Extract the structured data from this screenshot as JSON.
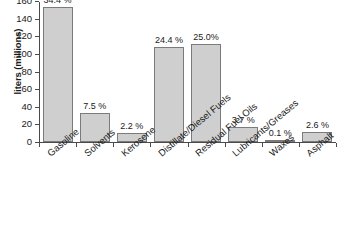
{
  "chart_data": {
    "type": "bar",
    "title": "",
    "xlabel": "",
    "ylabel": "liters (millions)",
    "ylim": [
      0,
      160
    ],
    "ytick_values": [
      0,
      20,
      40,
      60,
      80,
      100,
      120,
      140,
      160
    ],
    "ytick_labels": [
      "0",
      "20",
      "40",
      "60",
      "80",
      "100",
      "120",
      "140",
      "160"
    ],
    "grid": false,
    "legend": "none",
    "bar_color": "#cfcfcf",
    "bar_edge_color": "#7b7b7b",
    "axis_color": "#4a4a4a",
    "categories": [
      "Gasoline",
      "Solvents",
      "Kerosene",
      "Distillate/Diesel Fuels",
      "Residual Fuel Oils",
      "Lubricants/Greases",
      "Waxes",
      "Asphalt"
    ],
    "values": [
      153,
      33,
      10,
      108,
      111,
      16.5,
      0.5,
      11.5
    ],
    "data_labels": [
      "34.4 %",
      "7.5 %",
      "2.2 %",
      "24.4 %",
      "25.0%",
      "3.7 %",
      "0.1 %",
      "2.6 %"
    ],
    "percentages": [
      34.4,
      7.5,
      2.2,
      24.4,
      25.0,
      3.7,
      0.1,
      2.6
    ]
  }
}
